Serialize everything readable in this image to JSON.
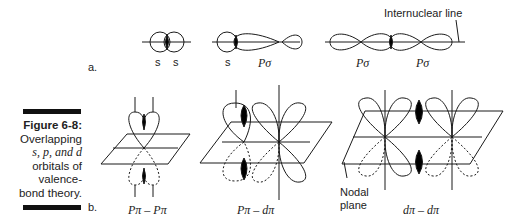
{
  "caption": {
    "title": "Figure 6-8:",
    "lines": [
      "Overlapping",
      "s, p, and d",
      "orbitals of",
      "valence-",
      "bond theory."
    ]
  },
  "part_a": {
    "label": "a.",
    "annotation": "Internuclear line",
    "diagrams": [
      {
        "labels": [
          "s",
          "s"
        ]
      },
      {
        "labels": [
          "s",
          "Pσ"
        ]
      },
      {
        "labels": [
          "Pσ",
          "Pσ"
        ]
      }
    ]
  },
  "part_b": {
    "label": "b.",
    "annotation": [
      "Nodal",
      "plane"
    ],
    "diagrams": [
      {
        "label": "Pπ – Pπ"
      },
      {
        "label": "Pπ – dπ"
      },
      {
        "label": "dπ – dπ"
      }
    ]
  },
  "colors": {
    "ink": "#1a1a1a",
    "fill": "#000000",
    "background": "#ffffff"
  }
}
